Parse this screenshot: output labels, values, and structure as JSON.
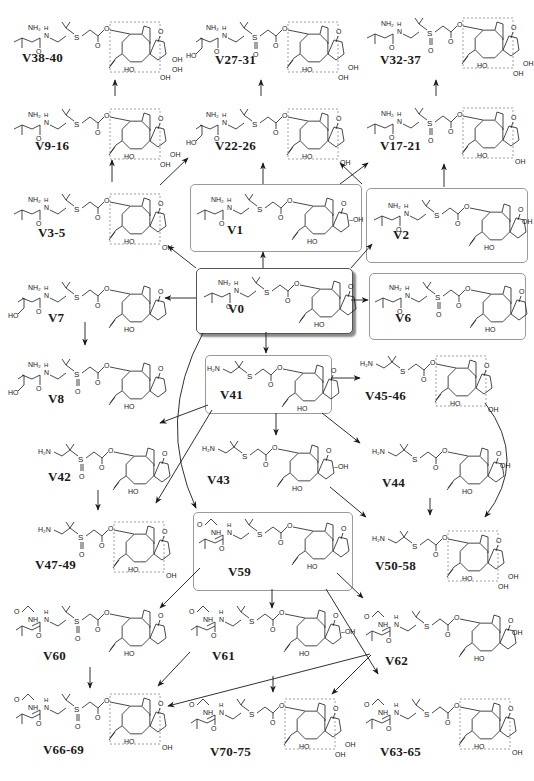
{
  "diagram": {
    "title": "",
    "colors": {
      "line": "#1a1a1a",
      "box_border": "#9a9a9a",
      "dashed_box": "#777777",
      "shadow": "#8a8a8a"
    },
    "boxes": [
      {
        "id": "box-V1",
        "x": 190,
        "y": 184,
        "w": 170,
        "h": 66,
        "main": false
      },
      {
        "id": "box-V2",
        "x": 366,
        "y": 188,
        "w": 160,
        "h": 73,
        "main": false
      },
      {
        "id": "box-V0",
        "x": 196,
        "y": 268,
        "w": 155,
        "h": 64,
        "main": true
      },
      {
        "id": "box-V6",
        "x": 369,
        "y": 273,
        "w": 155,
        "h": 65,
        "main": false
      },
      {
        "id": "box-V41",
        "x": 205,
        "y": 355,
        "w": 125,
        "h": 57,
        "main": false
      },
      {
        "id": "box-V59",
        "x": 193,
        "y": 512,
        "w": 158,
        "h": 77,
        "main": false
      }
    ],
    "compounds": [
      {
        "id": "V38-40",
        "label": "V38-40",
        "x": 10,
        "y": 18,
        "side": "val",
        "sulfur": "S",
        "core": "triOH",
        "dashed": true,
        "lx": 22,
        "ly": 60
      },
      {
        "id": "V27-31",
        "label": "V27-31",
        "x": 188,
        "y": 18,
        "side": "hydroxyval",
        "sulfur": "SO",
        "core": "diOH",
        "dashed": true,
        "lx": 215,
        "ly": 62
      },
      {
        "id": "V32-37",
        "label": "V32-37",
        "x": 363,
        "y": 14,
        "side": "val",
        "sulfur": "SO",
        "core": "diOH",
        "dashed": true,
        "lx": 380,
        "ly": 62
      },
      {
        "id": "V9-16",
        "label": "V9-16",
        "x": 10,
        "y": 105,
        "side": "val",
        "sulfur": "S",
        "core": "diOH",
        "dashed": true,
        "lx": 35,
        "ly": 148
      },
      {
        "id": "V22-26",
        "label": "V22-26",
        "x": 188,
        "y": 105,
        "side": "hydroxyval",
        "sulfur": "S",
        "core": "monoOH",
        "dashed": true,
        "lx": 215,
        "ly": 148
      },
      {
        "id": "V17-21",
        "label": "V17-21",
        "x": 363,
        "y": 104,
        "side": "val",
        "sulfur": "SO",
        "core": "monoOH",
        "dashed": true,
        "lx": 380,
        "ly": 148
      },
      {
        "id": "V3-5",
        "label": "V3-5",
        "x": 10,
        "y": 190,
        "side": "val",
        "sulfur": "S",
        "core": "monoOH",
        "dashed": true,
        "lx": 38,
        "ly": 235
      },
      {
        "id": "V1",
        "label": "V1",
        "x": 193,
        "y": 190,
        "side": "val",
        "sulfur": "S",
        "core": "ringOH",
        "dashed": false,
        "lx": 227,
        "ly": 232
      },
      {
        "id": "V2",
        "label": "V2",
        "x": 370,
        "y": 196,
        "side": "val",
        "sulfur": "S",
        "core": "ketoOH",
        "dashed": false,
        "lx": 393,
        "ly": 237
      },
      {
        "id": "V0",
        "label": "V0",
        "x": 200,
        "y": 273,
        "side": "val",
        "sulfur": "S",
        "core": "plain",
        "dashed": false,
        "lx": 228,
        "ly": 311
      },
      {
        "id": "V6",
        "label": "V6",
        "x": 371,
        "y": 278,
        "side": "val",
        "sulfur": "SO",
        "core": "plain",
        "dashed": false,
        "lx": 395,
        "ly": 320
      },
      {
        "id": "V7",
        "label": "V7",
        "x": 10,
        "y": 278,
        "side": "hydroxyval",
        "sulfur": "S",
        "core": "plain",
        "dashed": false,
        "lx": 48,
        "ly": 320
      },
      {
        "id": "V8",
        "label": "V8",
        "x": 10,
        "y": 355,
        "side": "hydroxyval",
        "sulfur": "SO",
        "core": "plain",
        "dashed": false,
        "lx": 48,
        "ly": 401
      },
      {
        "id": "V41",
        "label": "V41",
        "x": 207,
        "y": 357,
        "side": "amine",
        "sulfur": "S",
        "core": "plain",
        "dashed": false,
        "lx": 220,
        "ly": 397
      },
      {
        "id": "V45-46",
        "label": "V45-46",
        "x": 360,
        "y": 352,
        "side": "amine",
        "sulfur": "S",
        "core": "monoOH",
        "dashed": true,
        "lx": 365,
        "ly": 398
      },
      {
        "id": "V42",
        "label": "V42",
        "x": 38,
        "y": 440,
        "side": "amine",
        "sulfur": "SO",
        "core": "plain",
        "dashed": false,
        "lx": 48,
        "ly": 479
      },
      {
        "id": "V43",
        "label": "V43",
        "x": 202,
        "y": 437,
        "side": "amine",
        "sulfur": "S",
        "core": "ringOH",
        "dashed": false,
        "lx": 207,
        "ly": 482
      },
      {
        "id": "V44",
        "label": "V44",
        "x": 372,
        "y": 440,
        "side": "amine",
        "sulfur": "S",
        "core": "ketoOH",
        "dashed": false,
        "lx": 382,
        "ly": 485
      },
      {
        "id": "V47-49",
        "label": "V47-49",
        "x": 38,
        "y": 518,
        "side": "amine",
        "sulfur": "SO",
        "core": "monoOH",
        "dashed": true,
        "lx": 35,
        "ly": 567
      },
      {
        "id": "V50-58",
        "label": "V50-58",
        "x": 372,
        "y": 527,
        "side": "amine",
        "sulfur": "S",
        "core": "diOH",
        "dashed": true,
        "lx": 375,
        "ly": 568
      },
      {
        "id": "V59",
        "label": "V59",
        "x": 193,
        "y": 515,
        "side": "acetyl",
        "sulfur": "S",
        "core": "plain",
        "dashed": false,
        "lx": 228,
        "ly": 574
      },
      {
        "id": "V60",
        "label": "V60",
        "x": 10,
        "y": 602,
        "side": "acetyl",
        "sulfur": "SO",
        "core": "plain",
        "dashed": false,
        "lx": 43,
        "ly": 658
      },
      {
        "id": "V61",
        "label": "V61",
        "x": 185,
        "y": 602,
        "side": "acetyl",
        "sulfur": "S",
        "core": "ringOH",
        "dashed": false,
        "lx": 212,
        "ly": 658
      },
      {
        "id": "V62",
        "label": "V62",
        "x": 360,
        "y": 607,
        "side": "acetyl",
        "sulfur": "S",
        "core": "ketoOH",
        "dashed": false,
        "lx": 385,
        "ly": 663
      },
      {
        "id": "V66-69",
        "label": "V66-69",
        "x": 10,
        "y": 690,
        "side": "acetyl",
        "sulfur": "SO",
        "core": "monoOH",
        "dashed": true,
        "lx": 43,
        "ly": 752
      },
      {
        "id": "V70-75",
        "label": "V70-75",
        "x": 185,
        "y": 695,
        "side": "acetyl",
        "sulfur": "S",
        "core": "diOH",
        "dashed": true,
        "lx": 210,
        "ly": 754
      },
      {
        "id": "V63-65",
        "label": "V63-65",
        "x": 360,
        "y": 695,
        "side": "acetyl",
        "sulfur": "S",
        "core": "monoOH",
        "dashed": true,
        "lx": 380,
        "ly": 754
      }
    ],
    "arrows": [
      {
        "from": "V9-16",
        "to": "V38-40",
        "x1": 115,
        "y1": 96,
        "x2": 115,
        "y2": 80,
        "curve": 0
      },
      {
        "from": "V3-5",
        "to": "V9-16",
        "x1": 112,
        "y1": 182,
        "x2": 112,
        "y2": 160,
        "curve": 0
      },
      {
        "from": "V22-26",
        "to": "V27-31",
        "x1": 261,
        "y1": 96,
        "x2": 261,
        "y2": 80,
        "curve": 0
      },
      {
        "from": "V17-21",
        "to": "V32-37",
        "x1": 436,
        "y1": 96,
        "x2": 436,
        "y2": 80,
        "curve": 0
      },
      {
        "from": "V0",
        "to": "V3-5",
        "x1": 196,
        "y1": 268,
        "x2": 168,
        "y2": 246,
        "curve": 0
      },
      {
        "from": "V0",
        "to": "V22-26",
        "x1": 160,
        "y1": 185,
        "x2": 188,
        "y2": 158,
        "curve": 0
      },
      {
        "from": "V1",
        "to": "V22-26",
        "x1": 263,
        "y1": 184,
        "x2": 263,
        "y2": 163,
        "curve": 0
      },
      {
        "from": "V1",
        "to": "V17-21",
        "x1": 340,
        "y1": 184,
        "x2": 368,
        "y2": 163,
        "curve": 0
      },
      {
        "from": "V2",
        "to": "V22-26",
        "x1": 362,
        "y1": 184,
        "x2": 340,
        "y2": 163,
        "curve": 0
      },
      {
        "from": "V2",
        "to": "V17-21",
        "x1": 444,
        "y1": 187,
        "x2": 444,
        "y2": 164,
        "curve": 0
      },
      {
        "from": "V0",
        "to": "V1",
        "x1": 263,
        "y1": 268,
        "x2": 263,
        "y2": 252,
        "curve": 0
      },
      {
        "from": "V0",
        "to": "V2",
        "x1": 351,
        "y1": 268,
        "x2": 372,
        "y2": 244,
        "curve": 0
      },
      {
        "from": "V0",
        "to": "V6",
        "x1": 351,
        "y1": 300,
        "x2": 368,
        "y2": 300,
        "curve": 0
      },
      {
        "from": "V0",
        "to": "V7",
        "x1": 196,
        "y1": 298,
        "x2": 165,
        "y2": 298,
        "curve": 0
      },
      {
        "from": "V7",
        "to": "V8",
        "x1": 85,
        "y1": 322,
        "x2": 85,
        "y2": 345,
        "curve": 0
      },
      {
        "from": "V0",
        "to": "V41",
        "x1": 266,
        "y1": 332,
        "x2": 266,
        "y2": 353,
        "curve": 0
      },
      {
        "from": "V41",
        "to": "V45-46",
        "x1": 331,
        "y1": 378,
        "x2": 360,
        "y2": 378,
        "curve": 0
      },
      {
        "from": "V41",
        "to": "V42",
        "x1": 208,
        "y1": 405,
        "x2": 160,
        "y2": 423,
        "curve": 0
      },
      {
        "from": "V41",
        "to": "V47-49",
        "x1": 212,
        "y1": 410,
        "x2": 156,
        "y2": 503,
        "curve": 0
      },
      {
        "from": "V41",
        "to": "V43",
        "x1": 276,
        "y1": 413,
        "x2": 276,
        "y2": 435,
        "curve": 0
      },
      {
        "from": "V41",
        "to": "V44",
        "x1": 322,
        "y1": 413,
        "x2": 360,
        "y2": 443,
        "curve": 0
      },
      {
        "from": "V42",
        "to": "V47-49",
        "x1": 98,
        "y1": 490,
        "x2": 98,
        "y2": 510,
        "curve": 0
      },
      {
        "from": "V43",
        "to": "V50-58",
        "x1": 330,
        "y1": 487,
        "x2": 366,
        "y2": 517,
        "curve": 0
      },
      {
        "from": "V44",
        "to": "V50-58",
        "x1": 430,
        "y1": 498,
        "x2": 430,
        "y2": 515,
        "curve": 0
      },
      {
        "from": "V45-46",
        "to": "V50-58",
        "x1": 485,
        "y1": 403,
        "x2": 485,
        "y2": 517,
        "curve": 22
      },
      {
        "from": "V0",
        "to": "V59",
        "x1": 203,
        "y1": 333,
        "x2": 196,
        "y2": 508,
        "curve": -22
      },
      {
        "from": "V59",
        "to": "V60",
        "x1": 200,
        "y1": 568,
        "x2": 160,
        "y2": 608,
        "curve": 0
      },
      {
        "from": "V59",
        "to": "V61",
        "x1": 272,
        "y1": 589,
        "x2": 272,
        "y2": 608,
        "curve": 0
      },
      {
        "from": "V59",
        "to": "V62",
        "x1": 337,
        "y1": 573,
        "x2": 363,
        "y2": 598,
        "curve": 0
      },
      {
        "from": "V59",
        "to": "V63-65",
        "x1": 326,
        "y1": 589,
        "x2": 378,
        "y2": 674,
        "curve": 0
      },
      {
        "from": "V60",
        "to": "V66-69",
        "x1": 90,
        "y1": 667,
        "x2": 90,
        "y2": 688,
        "curve": 0
      },
      {
        "from": "V61",
        "to": "V66-69",
        "x1": 190,
        "y1": 652,
        "x2": 158,
        "y2": 686,
        "curve": 0
      },
      {
        "from": "V62",
        "to": "V66-69",
        "x1": 370,
        "y1": 654,
        "x2": 168,
        "y2": 706,
        "curve": 0
      },
      {
        "from": "V62",
        "to": "V70-75",
        "x1": 371,
        "y1": 655,
        "x2": 332,
        "y2": 694,
        "curve": 0
      },
      {
        "from": "V62",
        "to": "V70-75b",
        "x1": 273,
        "y1": 676,
        "x2": 273,
        "y2": 692,
        "curve": 0
      }
    ]
  }
}
